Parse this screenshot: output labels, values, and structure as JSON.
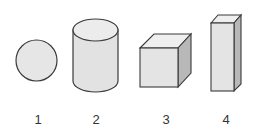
{
  "figure": {
    "shapes": [
      {
        "name": "sphere",
        "label": "1"
      },
      {
        "name": "cylinder",
        "label": "2"
      },
      {
        "name": "cube",
        "label": "3"
      },
      {
        "name": "rectangular-prism",
        "label": "4"
      }
    ],
    "colors": {
      "stroke": "#3a3a3a",
      "face_light": "#e4e4e4",
      "face_top": "#ececec",
      "face_side": "#b8b8b8",
      "label": "#333333"
    }
  }
}
